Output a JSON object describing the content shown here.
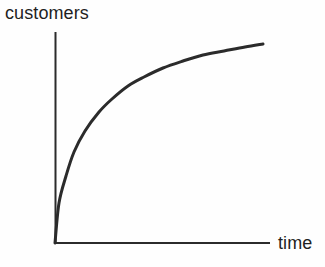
{
  "figure": {
    "background_color": "#fefefe",
    "stroke_color": "#2b2b2b",
    "text_color": "#1f1f1f",
    "width": 325,
    "height": 267
  },
  "chart_data": {
    "type": "line",
    "title": "",
    "subtitle": "",
    "xlabel": "time",
    "ylabel": "customers",
    "legend": [],
    "legend_position": "none",
    "grid": false,
    "axis_ticks": false,
    "tick_labels": {
      "x": [],
      "y": []
    },
    "xlim": [
      0,
      1
    ],
    "ylim": [
      0,
      1
    ],
    "series": [
      {
        "name": "customers over time",
        "color": "#2b2b2b",
        "x": [
          0.0,
          0.02,
          0.05,
          0.09,
          0.14,
          0.2,
          0.26,
          0.33,
          0.4,
          0.49,
          0.58,
          0.67,
          0.77,
          0.87,
          0.97
        ],
        "y": [
          0.0,
          0.19,
          0.32,
          0.43,
          0.53,
          0.62,
          0.68,
          0.74,
          0.79,
          0.84,
          0.87,
          0.9,
          0.92,
          0.93,
          0.94
        ]
      }
    ],
    "curve_points_px": [
      [
        55,
        243
      ],
      [
        59,
        203
      ],
      [
        66,
        176
      ],
      [
        74,
        152
      ],
      [
        85,
        131
      ],
      [
        99,
        112
      ],
      [
        112,
        99
      ],
      [
        128,
        86
      ],
      [
        144,
        77
      ],
      [
        163,
        68
      ],
      [
        183,
        61
      ],
      [
        203,
        55
      ],
      [
        224,
        51
      ],
      [
        245,
        47
      ],
      [
        263,
        44
      ]
    ],
    "axes_px": {
      "origin": [
        55,
        243
      ],
      "y_axis_top": [
        55,
        32
      ],
      "x_axis_right": [
        270,
        243
      ]
    }
  }
}
